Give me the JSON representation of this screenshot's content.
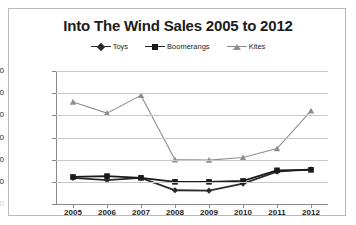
{
  "chart": {
    "title": "Into The Wind Sales 2005 to 2012",
    "legend": [
      {
        "label": "Toys",
        "marker": "diamond-marker",
        "color": "#2b2b2b"
      },
      {
        "label": "Boomerangs",
        "marker": "square-marker",
        "color": "#1a1a1a"
      },
      {
        "label": "Kites",
        "marker": "triangle-marker",
        "color": "#8e8e8e"
      }
    ]
  },
  "chart_data": {
    "type": "line",
    "title": "Into The Wind Sales 2005 to 2012",
    "xlabel": "",
    "ylabel": "",
    "categories": [
      "2005",
      "2006",
      "2007",
      "2008",
      "2009",
      "2010",
      "2011",
      "2012"
    ],
    "ylim": [
      0,
      30000
    ],
    "ytick_labels": [
      "0",
      "5,000",
      "10,000",
      "15,000",
      "20,000",
      "25,000",
      "30,000"
    ],
    "ytick_values": [
      0,
      5000,
      10000,
      15000,
      20000,
      25000,
      30000
    ],
    "grid": true,
    "legend_position": "top",
    "series": [
      {
        "name": "Toys",
        "color": "#2b2b2b",
        "marker": "diamond",
        "values": [
          5900,
          5400,
          5900,
          3100,
          3000,
          4600,
          7300,
          7800
        ]
      },
      {
        "name": "Boomerangs",
        "color": "#1a1a1a",
        "marker": "square",
        "values": [
          6100,
          6300,
          5900,
          5000,
          5000,
          5200,
          7600,
          7700
        ]
      },
      {
        "name": "Kites",
        "color": "#8e8e8e",
        "marker": "triangle",
        "values": [
          23000,
          20500,
          24500,
          10000,
          9900,
          10500,
          12500,
          21000
        ]
      }
    ]
  }
}
